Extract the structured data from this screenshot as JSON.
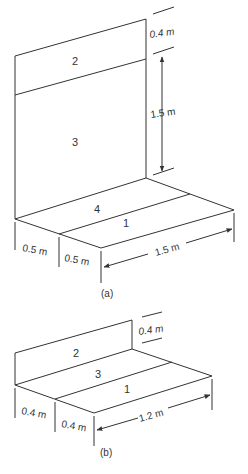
{
  "figure_a": {
    "caption": "(a)",
    "regions": {
      "r1": "1",
      "r2": "2",
      "r3": "3",
      "r4": "4"
    },
    "dims": {
      "top_height": "0.4 m",
      "wall_height": "1.5 m",
      "depth_left": "0.5 m",
      "depth_front": "0.5 m",
      "length": "1.5 m"
    }
  },
  "figure_b": {
    "caption": "(b)",
    "regions": {
      "r1": "1",
      "r2": "2",
      "r3": "3"
    },
    "dims": {
      "wall_height": "0.4 m",
      "depth_left": "0.4 m",
      "depth_front": "0.4 m",
      "length": "1.2 m"
    }
  }
}
